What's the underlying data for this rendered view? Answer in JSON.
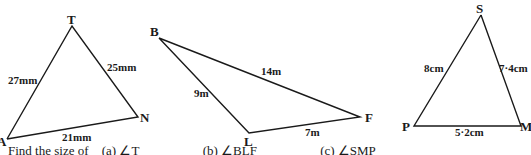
{
  "triangles": [
    {
      "name": "ATN",
      "vertices": {
        "T": "T",
        "A": "A",
        "N": "N"
      },
      "sides": {
        "AT": "27mm",
        "TN": "25mm",
        "AN": "21mm"
      }
    },
    {
      "name": "BLF",
      "vertices": {
        "B": "B",
        "L": "L",
        "F": "F"
      },
      "sides": {
        "BF": "14m",
        "BL": "9m",
        "LF": "7m"
      }
    },
    {
      "name": "SMP",
      "vertices": {
        "S": "S",
        "P": "P",
        "M": "M"
      },
      "sides": {
        "PS": "8cm",
        "SM": "7·4cm",
        "PM": "5·2cm"
      }
    }
  ],
  "question": {
    "prompt": "Find the size of",
    "parts": [
      "(a) ∠T",
      "(b) ∠BLF",
      "(c) ∠SMP"
    ]
  }
}
